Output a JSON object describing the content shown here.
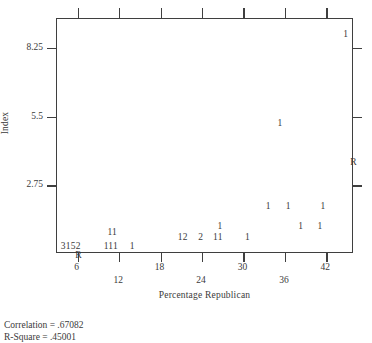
{
  "chart_data": {
    "type": "scatter",
    "title": "",
    "xlabel": "Percentage Republican",
    "ylabel": "Index",
    "xlim": [
      3,
      46
    ],
    "ylim": [
      0,
      9.4
    ],
    "grid": false,
    "legend": null,
    "note": "Character scatterplot: each plotted glyph is a digit giving the number of overlapping observations at that position; 'R' marks the regression line endpoints.",
    "x_ticks": [
      6,
      12,
      18,
      24,
      30,
      36,
      42
    ],
    "y_ticks": [
      2.75,
      5.5,
      8.25
    ],
    "points": [
      {
        "label": "3152",
        "x": 5.0,
        "y": 0.3
      },
      {
        "label": "11",
        "x": 11.0,
        "y": 0.86
      },
      {
        "label": "111",
        "x": 10.8,
        "y": 0.3
      },
      {
        "label": "1",
        "x": 13.9,
        "y": 0.3
      },
      {
        "label": "12",
        "x": 21.2,
        "y": 0.64
      },
      {
        "label": "2",
        "x": 23.8,
        "y": 0.64
      },
      {
        "label": "11",
        "x": 26.3,
        "y": 0.64
      },
      {
        "label": "1",
        "x": 26.6,
        "y": 1.1
      },
      {
        "label": "1",
        "x": 30.6,
        "y": 0.64
      },
      {
        "label": "1",
        "x": 33.6,
        "y": 1.88
      },
      {
        "label": "1",
        "x": 36.5,
        "y": 1.88
      },
      {
        "label": "1",
        "x": 38.3,
        "y": 1.1
      },
      {
        "label": "1",
        "x": 41.1,
        "y": 1.1
      },
      {
        "label": "1",
        "x": 41.5,
        "y": 1.88
      },
      {
        "label": "1",
        "x": 35.3,
        "y": 5.22
      },
      {
        "label": "1",
        "x": 44.8,
        "y": 8.78
      }
    ],
    "regression_markers": [
      {
        "label": "R",
        "x": 6.1,
        "y": -0.08
      },
      {
        "label": "R",
        "x": 45.9,
        "y": 3.64
      }
    ],
    "statistics": [
      "Correlation = .67082",
      "R-Square = .45001"
    ]
  }
}
